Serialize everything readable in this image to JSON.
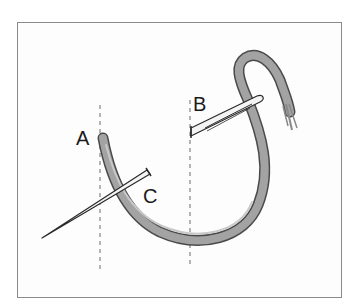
{
  "diagram": {
    "labels": [
      {
        "id": "A",
        "text": "A"
      },
      {
        "id": "B",
        "text": "B"
      },
      {
        "id": "C",
        "text": "C"
      }
    ],
    "colors": {
      "thread": "#9a9a9a",
      "thread_outline": "#4a4a4a",
      "needle": "#f4f4f4",
      "needle_outline": "#2a2a2a",
      "guide_line": "#6a6a6a",
      "frame_border": "#8a8a8a"
    }
  }
}
